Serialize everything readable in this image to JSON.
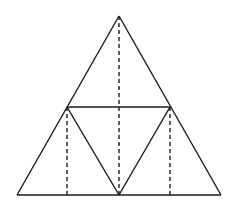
{
  "diagram": {
    "colors": {
      "stroke": "#1a1a1a",
      "background": "#ffffff"
    },
    "points": {
      "apex": [
        119,
        16
      ],
      "bottom_left": [
        17,
        195
      ],
      "bottom_right": [
        221,
        195
      ],
      "left_mid": [
        67,
        107
      ],
      "right_mid": [
        170,
        107
      ],
      "bottom_mid": [
        119,
        195
      ]
    },
    "solid_segments": [
      {
        "name": "outer-left-edge",
        "from": "apex",
        "to": "bottom_left"
      },
      {
        "name": "outer-right-edge",
        "from": "apex",
        "to": "bottom_right"
      },
      {
        "name": "outer-base",
        "from": "bottom_left",
        "to": "bottom_right"
      },
      {
        "name": "mid-horizontal",
        "from": "left_mid",
        "to": "right_mid"
      },
      {
        "name": "inner-left-edge",
        "from": "left_mid",
        "to": "bottom_mid"
      },
      {
        "name": "inner-right-edge",
        "from": "right_mid",
        "to": "bottom_mid"
      }
    ],
    "dashed_segments": [
      {
        "name": "central-altitude",
        "from": "apex",
        "to": "bottom_mid"
      },
      {
        "name": "left-altitude",
        "from": "left_mid",
        "to": [
          67,
          195
        ]
      },
      {
        "name": "right-altitude",
        "from": "right_mid",
        "to": [
          170,
          195
        ]
      }
    ]
  }
}
